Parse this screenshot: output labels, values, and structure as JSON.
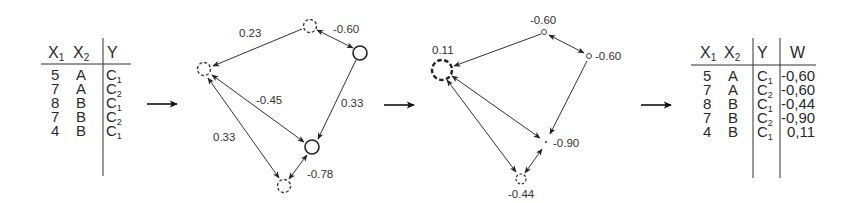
{
  "input_table": {
    "headers": [
      "X1",
      "X2",
      "Y"
    ],
    "header_parts": [
      {
        "main": "X",
        "sub": "1"
      },
      {
        "main": "X",
        "sub": "2"
      },
      {
        "main": "Y",
        "sub": ""
      }
    ],
    "rows": [
      {
        "x1": "5",
        "x2": "A",
        "y_main": "C",
        "y_sub": "1"
      },
      {
        "x1": "7",
        "x2": "A",
        "y_main": "C",
        "y_sub": "2"
      },
      {
        "x1": "8",
        "x2": "B",
        "y_main": "C",
        "y_sub": "1"
      },
      {
        "x1": "7",
        "x2": "B",
        "y_main": "C",
        "y_sub": "2"
      },
      {
        "x1": "4",
        "x2": "B",
        "y_main": "C",
        "y_sub": "1"
      }
    ]
  },
  "graph_1": {
    "nodes": [
      {
        "id": "n1",
        "style": "dashed",
        "size": "small"
      },
      {
        "id": "n2",
        "style": "dashed",
        "size": "small"
      },
      {
        "id": "n3",
        "style": "solid",
        "size": "small"
      },
      {
        "id": "n4",
        "style": "solid",
        "size": "small"
      },
      {
        "id": "n5",
        "style": "dashed",
        "size": "small"
      }
    ],
    "edges": [
      {
        "from": "n2",
        "to": "n1",
        "label": "0.23",
        "direction": "forward"
      },
      {
        "from": "n2",
        "to": "n3",
        "label": "-0.60",
        "direction": "both"
      },
      {
        "from": "n3",
        "to": "n4",
        "label": "0.33",
        "direction": "forward"
      },
      {
        "from": "n1",
        "to": "n4",
        "label": "-0.45",
        "direction": "both"
      },
      {
        "from": "n1",
        "to": "n5",
        "label": "0.33",
        "direction": "both"
      },
      {
        "from": "n5",
        "to": "n4",
        "label": "-0.78",
        "direction": "both"
      }
    ]
  },
  "graph_2": {
    "nodes": [
      {
        "id": "m1",
        "style": "dashed-bold",
        "size": "large",
        "weight": "0.11"
      },
      {
        "id": "m2",
        "style": "solid",
        "size": "tiny",
        "weight": "-0.60"
      },
      {
        "id": "m3",
        "style": "solid",
        "size": "tiny",
        "weight": "-0.60"
      },
      {
        "id": "m4",
        "style": "dot",
        "size": "point",
        "weight": "-0.90"
      },
      {
        "id": "m5",
        "style": "dashed",
        "size": "small",
        "weight": "-0.44"
      }
    ],
    "edges": [
      {
        "from": "m2",
        "to": "m1",
        "direction": "forward"
      },
      {
        "from": "m2",
        "to": "m3",
        "direction": "both"
      },
      {
        "from": "m3",
        "to": "m4",
        "direction": "forward"
      },
      {
        "from": "m1",
        "to": "m4",
        "direction": "both"
      },
      {
        "from": "m1",
        "to": "m5",
        "direction": "both"
      },
      {
        "from": "m5",
        "to": "m4",
        "direction": "both"
      }
    ]
  },
  "output_table": {
    "headers": [
      "X1",
      "X2",
      "Y",
      "W"
    ],
    "header_parts": [
      {
        "main": "X",
        "sub": "1"
      },
      {
        "main": "X",
        "sub": "2"
      },
      {
        "main": "Y",
        "sub": ""
      },
      {
        "main": "W",
        "sub": ""
      }
    ],
    "rows": [
      {
        "x1": "5",
        "x2": "A",
        "y_main": "C",
        "y_sub": "1",
        "w": "-0,60"
      },
      {
        "x1": "7",
        "x2": "A",
        "y_main": "C",
        "y_sub": "2",
        "w": "-0,60"
      },
      {
        "x1": "8",
        "x2": "B",
        "y_main": "C",
        "y_sub": "1",
        "w": "-0,44"
      },
      {
        "x1": "7",
        "x2": "B",
        "y_main": "C",
        "y_sub": "2",
        "w": "-0,90"
      },
      {
        "x1": "4",
        "x2": "B",
        "y_main": "C",
        "y_sub": "1",
        "w": "0,11"
      }
    ]
  },
  "stage_arrows": [
    "table-to-graph",
    "graph-to-weighted-graph",
    "weighted-graph-to-table"
  ]
}
